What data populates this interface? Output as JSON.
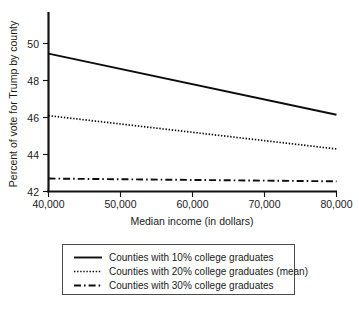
{
  "chart_data": {
    "type": "line",
    "title": "",
    "xlabel": "Median income (in dollars)",
    "ylabel": "Percent of vote for Trump by county",
    "xlim": [
      40000,
      80000
    ],
    "ylim": [
      42,
      51.2
    ],
    "grid": false,
    "legend_position": "below-center",
    "x_ticks": [
      40000,
      50000,
      60000,
      70000,
      80000
    ],
    "x_tick_labels": [
      "40,000",
      "50,000",
      "60,000",
      "70,000",
      "80,000"
    ],
    "y_ticks": [
      42,
      44,
      46,
      48,
      50
    ],
    "y_tick_labels": [
      "42",
      "44",
      "46",
      "48",
      "50"
    ],
    "x": [
      40000,
      80000
    ],
    "series": [
      {
        "name": "Counties with 10% college graduates",
        "style": "solid",
        "values": [
          49.45,
          46.15
        ]
      },
      {
        "name": "Counties with 20% college graduates (mean)",
        "style": "dotted",
        "values": [
          46.1,
          44.3
        ]
      },
      {
        "name": "Counties with 30% college graduates",
        "style": "dash-dot",
        "values": [
          42.7,
          42.55
        ]
      }
    ],
    "colors": {
      "line": "#0d0d0d",
      "axis": "#111111",
      "text": "#1a1a1a",
      "legend_border": "#4a4a4a",
      "background": "#ffffff"
    }
  },
  "axes": {
    "y_title": "Percent of vote for Trump by county",
    "x_title": "Median income (in dollars)",
    "y_tick_labels": [
      "50",
      "48",
      "46",
      "44",
      "42"
    ],
    "x_tick_labels": [
      "40,000",
      "50,000",
      "60,000",
      "70,000",
      "80,000"
    ]
  },
  "legend": {
    "entries": [
      {
        "label": "Counties with 10% college graduates",
        "style": "solid"
      },
      {
        "label": "Counties with 20% college graduates (mean)",
        "style": "dotted"
      },
      {
        "label": "Counties with 30% college graduates",
        "style": "dash-dot"
      }
    ]
  }
}
